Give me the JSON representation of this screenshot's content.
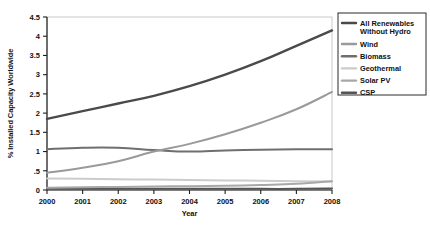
{
  "chart_data": {
    "type": "line",
    "title": "",
    "xlabel": "Year",
    "ylabel": "% Installed Capacity Worldwide",
    "x": [
      2000,
      2001,
      2002,
      2003,
      2004,
      2005,
      2006,
      2007,
      2008
    ],
    "xtick_labels": [
      "2000",
      "2001",
      "2002",
      "2003",
      "2004",
      "2005",
      "2006",
      "2007",
      "2008"
    ],
    "ytick_labels": [
      "0",
      ".5",
      "1",
      "1.5",
      "2",
      "2.5",
      "3",
      "3.5",
      "4",
      "4.5"
    ],
    "ytick_values": [
      0,
      0.5,
      1,
      1.5,
      2,
      2.5,
      3,
      3.5,
      4,
      4.5
    ],
    "xlim": [
      2000,
      2008
    ],
    "ylim": [
      0,
      4.5
    ],
    "grid": false,
    "legend_position": "right-top",
    "series": [
      {
        "name": "All Renewables Without Hydro",
        "color": "#4a4a4a",
        "width": 2.4,
        "values": [
          1.85,
          2.05,
          2.25,
          2.45,
          2.7,
          3.0,
          3.35,
          3.75,
          4.15
        ]
      },
      {
        "name": "Wind",
        "color": "#9a9a9a",
        "width": 2.0,
        "values": [
          0.45,
          0.58,
          0.75,
          1.0,
          1.2,
          1.45,
          1.75,
          2.1,
          2.55
        ]
      },
      {
        "name": "Biomass",
        "color": "#6f6f6f",
        "width": 2.0,
        "values": [
          1.06,
          1.1,
          1.1,
          1.04,
          1.0,
          1.03,
          1.05,
          1.06,
          1.06
        ]
      },
      {
        "name": "Geothermal",
        "color": "#cccccc",
        "width": 2.0,
        "values": [
          0.3,
          0.29,
          0.28,
          0.27,
          0.26,
          0.25,
          0.24,
          0.23,
          0.22
        ]
      },
      {
        "name": "Solar PV",
        "color": "#a8a8a8",
        "width": 2.0,
        "values": [
          0.06,
          0.07,
          0.08,
          0.09,
          0.1,
          0.11,
          0.13,
          0.16,
          0.23
        ]
      },
      {
        "name": "CSP",
        "color": "#555555",
        "width": 2.0,
        "values": [
          0.03,
          0.03,
          0.03,
          0.03,
          0.03,
          0.03,
          0.03,
          0.03,
          0.04
        ]
      }
    ]
  },
  "legend": {
    "entries": [
      {
        "label_line1": "All Renewables",
        "label_line2": "Without Hydro",
        "color": "#4a4a4a"
      },
      {
        "label_line1": "Wind",
        "label_line2": "",
        "color": "#9a9a9a"
      },
      {
        "label_line1": "Biomass",
        "label_line2": "",
        "color": "#6f6f6f"
      },
      {
        "label_line1": "Geothermal",
        "label_line2": "",
        "color": "#cccccc"
      },
      {
        "label_line1": "Solar PV",
        "label_line2": "",
        "color": "#a8a8a8"
      },
      {
        "label_line1": "CSP",
        "label_line2": "",
        "color": "#555555"
      }
    ]
  }
}
